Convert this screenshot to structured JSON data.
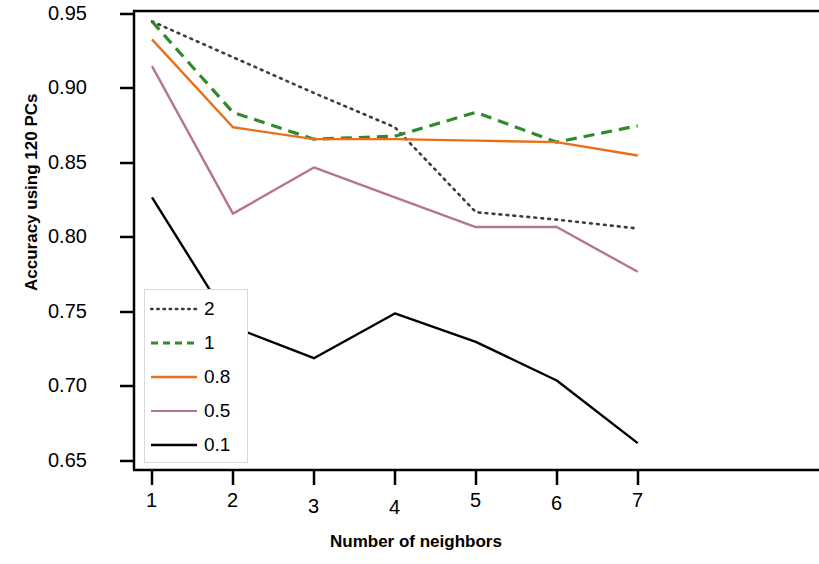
{
  "chart_data": {
    "type": "line",
    "title": "",
    "xlabel": "Number of neighbors",
    "ylabel": "Accuracy using 120 PCs",
    "x": [
      1,
      2,
      3,
      4,
      5,
      6,
      7
    ],
    "xticklabels": [
      "1",
      "2",
      "3",
      "4",
      "5",
      "6",
      "7"
    ],
    "yticklabels": [
      "0.95",
      "0.90",
      "0.85",
      "0.80",
      "0.75",
      "0.70",
      "0.65"
    ],
    "yticks": [
      0.95,
      0.9,
      0.85,
      0.8,
      0.75,
      0.7,
      0.65
    ],
    "xlim": [
      0.72,
      7.5
    ],
    "ylim": [
      0.6435,
      0.9565
    ],
    "grid": false,
    "legend_position": "bottom-left",
    "series": [
      {
        "name": "2",
        "color": "#3c3c3c",
        "linestyle": "dotted",
        "values": [
          0.945,
          0.921,
          0.897,
          0.874,
          0.817,
          0.812,
          0.806
        ]
      },
      {
        "name": "1",
        "color": "#2e8b2e",
        "linestyle": "dashed",
        "values": [
          0.945,
          0.884,
          0.866,
          0.868,
          0.884,
          0.864,
          0.875
        ]
      },
      {
        "name": "0.8",
        "color": "#e8701a",
        "linestyle": "solid",
        "values": [
          0.933,
          0.874,
          0.866,
          0.866,
          0.865,
          0.864,
          0.855
        ]
      },
      {
        "name": "0.5",
        "color": "#b5758f",
        "linestyle": "solid",
        "values": [
          0.915,
          0.816,
          0.847,
          0.827,
          0.807,
          0.807,
          0.777
        ]
      },
      {
        "name": "0.1",
        "color": "#000000",
        "linestyle": "solid",
        "values": [
          0.827,
          0.74,
          0.719,
          0.749,
          0.73,
          0.704,
          0.662
        ]
      }
    ]
  },
  "axis": {
    "y_label": "Accuracy using 120 PCs",
    "x_label": "Number of neighbors",
    "y_ticks": [
      "0.95",
      "0.90",
      "0.85",
      "0.80",
      "0.75",
      "0.70",
      "0.65"
    ],
    "x_ticks": [
      "1",
      "2",
      "3",
      "4",
      "5",
      "6",
      "7"
    ]
  },
  "legend": {
    "items": [
      {
        "label": "2"
      },
      {
        "label": "1"
      },
      {
        "label": "0.8"
      },
      {
        "label": "0.5"
      },
      {
        "label": "0.1"
      }
    ]
  }
}
